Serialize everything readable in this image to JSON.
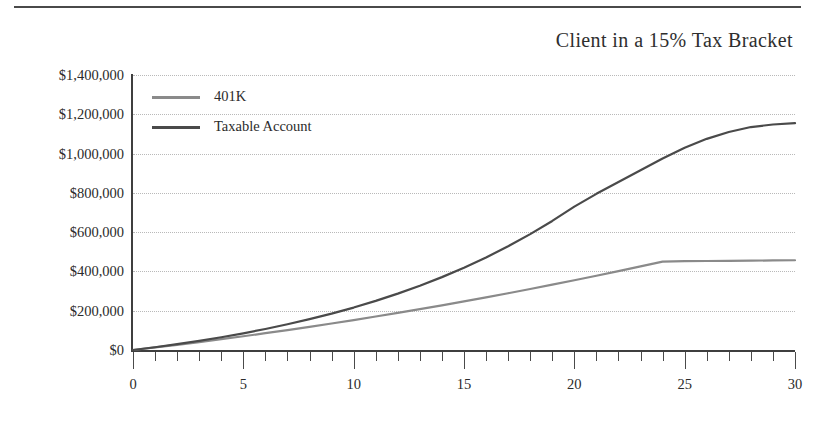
{
  "chart_data": {
    "type": "line",
    "title": "Client in a 15% Tax Bracket",
    "xlabel": "",
    "ylabel": "",
    "xlim": [
      0,
      30
    ],
    "ylim": [
      0,
      1400000
    ],
    "grid": "horizontal-dotted",
    "legend_position": "top-left-inside",
    "x_ticks_major": [
      0,
      5,
      10,
      15,
      20,
      25,
      30
    ],
    "x_tick_labels": [
      "0",
      "5",
      "10",
      "15",
      "20",
      "25",
      "30"
    ],
    "x_minor_tick_interval": 1,
    "y_ticks": [
      0,
      200000,
      400000,
      600000,
      800000,
      1000000,
      1200000,
      1400000
    ],
    "y_tick_labels": [
      "$0",
      "$200,000",
      "$400,000",
      "$600,000",
      "$800,000",
      "$1,000,000",
      "$1,200,000",
      "$1,400,000"
    ],
    "x": [
      0,
      1,
      2,
      3,
      4,
      5,
      6,
      7,
      8,
      9,
      10,
      11,
      12,
      13,
      14,
      15,
      16,
      17,
      18,
      19,
      20,
      21,
      22,
      23,
      24,
      25,
      26,
      27,
      28,
      29,
      30
    ],
    "series": [
      {
        "name": "401K",
        "color": "#8a8a8a",
        "values": [
          0,
          13000,
          26500,
          40500,
          55000,
          70000,
          85500,
          101500,
          118000,
          135000,
          152500,
          170500,
          189000,
          208000,
          227500,
          247500,
          268000,
          289000,
          310500,
          332500,
          355000,
          378000,
          401500,
          425500,
          450000,
          452000,
          453000,
          454000,
          455000,
          456000,
          457000
        ]
      },
      {
        "name": "Taxable Account",
        "color": "#4a4a4a",
        "values": [
          0,
          14000,
          29500,
          46500,
          65000,
          85000,
          107000,
          131000,
          157000,
          185000,
          216000,
          250000,
          287000,
          327000,
          371000,
          419000,
          471000,
          528000,
          590000,
          657000,
          730000,
          795000,
          855000,
          915000,
          975000,
          1030000,
          1075000,
          1110000,
          1135000,
          1148000,
          1155000
        ]
      }
    ]
  },
  "legend": {
    "items": [
      {
        "label": "401K",
        "color": "#8a8a8a"
      },
      {
        "label": "Taxable Account",
        "color": "#4a4a4a"
      }
    ]
  }
}
